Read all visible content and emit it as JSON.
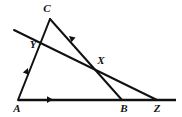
{
  "figure": {
    "background_color": "#ffffff",
    "stroke_color": "#111111",
    "width": 182,
    "height": 117,
    "points": {
      "A": {
        "label": "A",
        "x": 18,
        "y": 100,
        "label_x": 17,
        "label_y": 112
      },
      "B": {
        "label": "B",
        "x": 122,
        "y": 100,
        "label_x": 124,
        "label_y": 112
      },
      "C": {
        "label": "C",
        "x": 50,
        "y": 19,
        "label_x": 47,
        "label_y": 12
      },
      "X": {
        "label": "X",
        "x": 97,
        "y": 68,
        "label_x": 101,
        "label_y": 64
      },
      "Y": {
        "label": "Y",
        "x": 40,
        "y": 39,
        "label_x": 33,
        "label_y": 48
      },
      "Z": {
        "label": "Z",
        "x": 157,
        "y": 100,
        "label_x": 157,
        "label_y": 112
      }
    },
    "segments": [
      {
        "name": "base-line-A-Z",
        "from": "A",
        "to": "Z",
        "extend_to_x": 176,
        "width": 2.2
      },
      {
        "name": "side-A-C",
        "from": "A",
        "to": "C",
        "width": 1.9
      },
      {
        "name": "cevian-C-B",
        "from": "C",
        "to": "B",
        "width": 1.9
      },
      {
        "name": "transversal-Y-Z",
        "from": "Y",
        "to": "Z",
        "extend_from_x": 14,
        "extend_from_y": 30,
        "width": 1.9
      }
    ],
    "arrow_marks": [
      {
        "name": "arrow-mark-side-A-C",
        "x": 28,
        "y": 68,
        "angle": -78,
        "on": "side-A-C"
      },
      {
        "name": "arrow-mark-base-A-B",
        "x": 51,
        "y": 99,
        "angle": 0,
        "on": "base-line-A-Z"
      },
      {
        "name": "arrow-mark-cevian-C-X",
        "x": 71,
        "y": 38,
        "angle": 221,
        "on": "cevian-C-B"
      }
    ]
  }
}
